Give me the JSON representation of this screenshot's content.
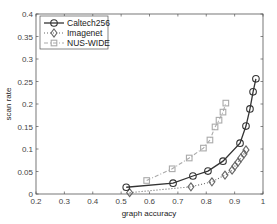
{
  "chart_data": {
    "type": "line",
    "title": "",
    "xlabel": "graph accuracy",
    "ylabel": "scan rate",
    "xlim": [
      0.2,
      1.0
    ],
    "ylim": [
      0,
      0.4
    ],
    "xticks": [
      0.2,
      0.3,
      0.4,
      0.5,
      0.6,
      0.7,
      0.8,
      0.9,
      1
    ],
    "xtick_labels": [
      "0.2",
      "0.3",
      "0.4",
      "0.5",
      "0.6",
      "0.7",
      "0.8",
      "0.9",
      "1"
    ],
    "yticks": [
      0,
      0.05,
      0.1,
      0.15,
      0.2,
      0.25,
      0.3,
      0.35,
      0.4
    ],
    "ytick_labels": [
      "0",
      "0.05",
      "0.1",
      "0.15",
      "0.2",
      "0.25",
      "0.3",
      "0.35",
      "0.4"
    ],
    "grid": false,
    "legend_position": "upper left",
    "series": [
      {
        "name": "Caltech256",
        "color": "#333333",
        "line_style": "solid",
        "marker": "circle",
        "x": [
          0.518,
          0.683,
          0.753,
          0.806,
          0.859,
          0.919,
          0.94,
          0.954,
          0.965,
          0.975
        ],
        "y": [
          0.015,
          0.024,
          0.04,
          0.051,
          0.073,
          0.113,
          0.151,
          0.189,
          0.227,
          0.256
        ]
      },
      {
        "name": "Imagenet",
        "color": "#666666",
        "line_style": "dotted",
        "marker": "diamond",
        "x": [
          0.53,
          0.746,
          0.82,
          0.866,
          0.891,
          0.901,
          0.912,
          0.922,
          0.933,
          0.94
        ],
        "y": [
          0.003,
          0.016,
          0.027,
          0.042,
          0.053,
          0.062,
          0.071,
          0.08,
          0.089,
          0.098
        ]
      },
      {
        "name": "NUS-WIDE",
        "color": "#aaaaaa",
        "line_style": "dashdot",
        "marker": "square",
        "x": [
          0.59,
          0.68,
          0.74,
          0.79,
          0.813,
          0.831,
          0.845,
          0.859,
          0.869
        ],
        "y": [
          0.03,
          0.056,
          0.08,
          0.102,
          0.12,
          0.149,
          0.164,
          0.182,
          0.202
        ]
      }
    ]
  },
  "layout": {
    "plot_left": 36,
    "plot_right": 263,
    "plot_top": 14,
    "plot_bottom": 194
  }
}
